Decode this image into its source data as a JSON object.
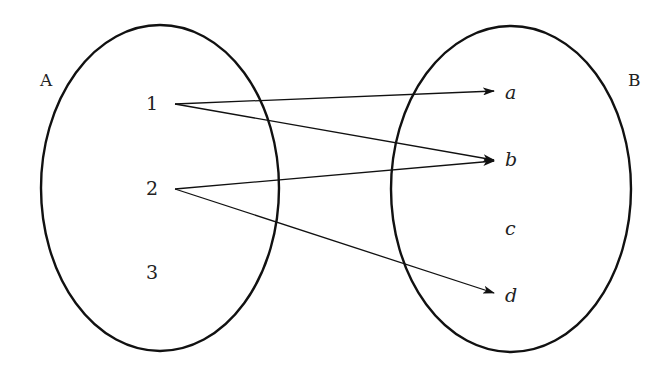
{
  "diagram": {
    "type": "mapping-diagram",
    "sets": [
      {
        "label": "A",
        "elements": [
          "1",
          "2",
          "3"
        ]
      },
      {
        "label": "B",
        "elements": [
          "a",
          "b",
          "c",
          "d"
        ]
      }
    ],
    "mappings": [
      {
        "from": "1",
        "to": "a"
      },
      {
        "from": "1",
        "to": "b"
      },
      {
        "from": "2",
        "to": "b"
      },
      {
        "from": "2",
        "to": "d"
      }
    ],
    "colors": {
      "stroke": "#111111",
      "text": "#222222",
      "background": "#ffffff"
    }
  }
}
